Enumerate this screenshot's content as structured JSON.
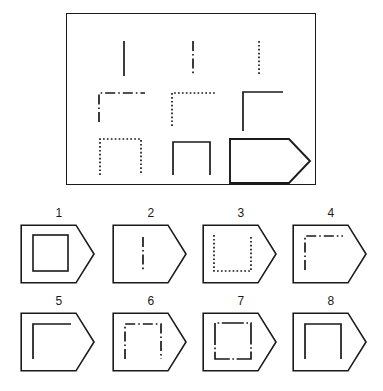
{
  "puzzle": {
    "title": "Matrix Reasoning Item",
    "type": "progressive-matrix",
    "matrix": {
      "rows": 3,
      "columns": 3,
      "cells": [
        {
          "row": 1,
          "col": 1,
          "figure": "vertical-line",
          "stroke": "solid",
          "name": "matrix-cell-1-1"
        },
        {
          "row": 1,
          "col": 2,
          "figure": "vertical-line",
          "stroke": "dash-dot",
          "name": "matrix-cell-1-2"
        },
        {
          "row": 1,
          "col": 3,
          "figure": "vertical-line",
          "stroke": "dotted",
          "name": "matrix-cell-1-3"
        },
        {
          "row": 2,
          "col": 1,
          "figure": "corner-top-left",
          "stroke": "dash-dot",
          "name": "matrix-cell-2-1"
        },
        {
          "row": 2,
          "col": 2,
          "figure": "corner-top-left",
          "stroke": "dotted",
          "name": "matrix-cell-2-2"
        },
        {
          "row": 2,
          "col": 3,
          "figure": "corner-top-left",
          "stroke": "solid",
          "name": "matrix-cell-2-3"
        },
        {
          "row": 3,
          "col": 1,
          "figure": "open-bottom-square",
          "stroke": "dotted",
          "name": "matrix-cell-3-1"
        },
        {
          "row": 3,
          "col": 2,
          "figure": "open-bottom-square",
          "stroke": "solid",
          "name": "matrix-cell-3-2"
        },
        {
          "row": 3,
          "col": 3,
          "figure": "missing-answer-slot",
          "stroke": "solid",
          "name": "matrix-cell-3-3-answer-slot"
        }
      ]
    },
    "options": [
      {
        "label": "1",
        "figure": "closed-square",
        "stroke": "solid"
      },
      {
        "label": "2",
        "figure": "vertical-line",
        "stroke": "dash-dot"
      },
      {
        "label": "3",
        "figure": "open-top-square",
        "stroke": "dotted"
      },
      {
        "label": "4",
        "figure": "corner-top-left",
        "stroke": "dash-dot"
      },
      {
        "label": "5",
        "figure": "corner-top-left",
        "stroke": "solid"
      },
      {
        "label": "6",
        "figure": "open-bottom-square",
        "stroke": "dash-dot"
      },
      {
        "label": "7",
        "figure": "closed-square",
        "stroke": "solid-with-dash-dot-gaps"
      },
      {
        "label": "8",
        "figure": "open-bottom-square",
        "stroke": "solid"
      }
    ],
    "colors": {
      "ink": "#1a1a1a",
      "background": "#ffffff"
    }
  }
}
